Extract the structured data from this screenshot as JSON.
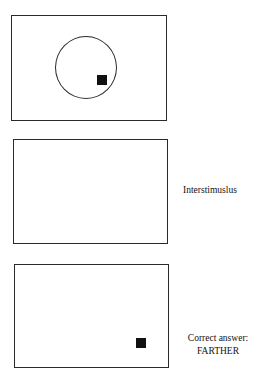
{
  "panels": [
    {
      "id": "stimulus",
      "label": "",
      "has_circle": true,
      "has_target_square": true
    },
    {
      "id": "interstimulus",
      "label": "Interstimuslus",
      "has_circle": false,
      "has_target_square": false
    },
    {
      "id": "probe",
      "label_line1": "Correct answer:",
      "label_line2": "FARTHER",
      "has_circle": false,
      "has_target_square": true
    }
  ],
  "colors": {
    "frame": "#2a2a2a",
    "square": "#111111",
    "background": "#ffffff"
  }
}
